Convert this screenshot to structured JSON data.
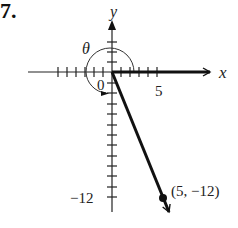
{
  "problem_number": "7.",
  "diagram": {
    "axis_labels": {
      "x": "x",
      "y": "y"
    },
    "origin_label": "0",
    "angle_label": "θ",
    "tick_labels": {
      "x_5": "5",
      "y_neg12": "−12"
    },
    "point": {
      "x": 5,
      "y": -12,
      "label": "(5, −12)"
    },
    "colors": {
      "ink": "#111111",
      "text": "#222222"
    }
  }
}
